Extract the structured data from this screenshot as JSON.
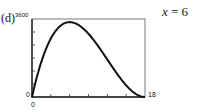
{
  "panel_label": "(d)",
  "annotation": {
    "var": "x",
    "eq": "= 6"
  },
  "chart_data": {
    "type": "line",
    "title": "",
    "xlabel": "",
    "ylabel": "",
    "xlim": [
      0,
      18
    ],
    "ylim": [
      0,
      3600
    ],
    "tick_labels": {
      "x": [
        "0",
        "18"
      ],
      "y": [
        "0",
        "3600"
      ]
    },
    "x_ticks_count": 6,
    "y_ticks_count": 6,
    "grid": false,
    "series": [
      {
        "name": "V(x) = x(36 - 2x)^2",
        "x": [
          0,
          1,
          2,
          3,
          4,
          5,
          6,
          7,
          8,
          9,
          10,
          11,
          12,
          13,
          14,
          15,
          16,
          17,
          18
        ],
        "y": [
          0,
          1156,
          2048,
          2700,
          3136,
          3380,
          3456,
          3388,
          3200,
          2916,
          2560,
          2156,
          1728,
          1300,
          896,
          540,
          256,
          68,
          0
        ]
      }
    ],
    "annotation": "x = 6"
  }
}
